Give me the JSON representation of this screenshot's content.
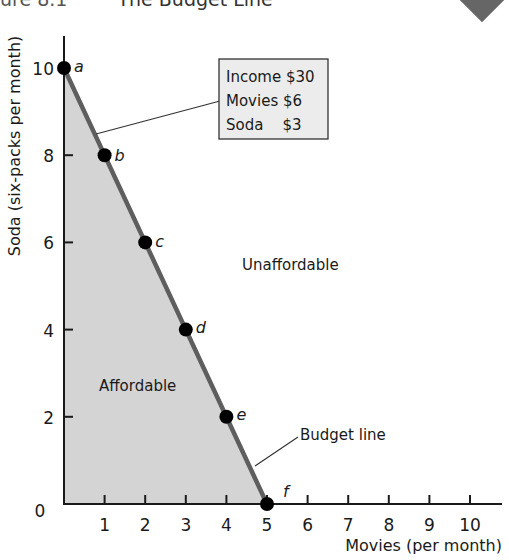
{
  "header": {
    "figure_label": "ure 8.1",
    "title": "The Budget Line"
  },
  "colors": {
    "affordable_fill": "#d4d4d4",
    "budget_line": "#5e5e5e",
    "axis": "#1a1a1a",
    "point": "#000000",
    "diamond": "#666666"
  },
  "legend_box": {
    "lines": [
      "Income $30",
      "Movies $6",
      "Soda    $3"
    ]
  },
  "labels": {
    "unaffordable": "Unaffordable",
    "affordable": "Affordable",
    "budget_line": "Budget line"
  },
  "chart_data": {
    "type": "line",
    "title": "The Budget Line",
    "xlabel": "Movies (per month)",
    "ylabel": "Soda (six-packs per month)",
    "xlim": [
      0,
      10
    ],
    "ylim": [
      0,
      10
    ],
    "x_ticks": [
      1,
      2,
      3,
      4,
      5,
      6,
      7,
      8,
      9,
      10
    ],
    "y_ticks": [
      2,
      4,
      6,
      8,
      10
    ],
    "origin_label": "0",
    "grid": false,
    "legend": "none",
    "series": [
      {
        "name": "Budget line",
        "points": [
          {
            "label": "a",
            "x": 0,
            "y": 10
          },
          {
            "label": "b",
            "x": 1,
            "y": 8
          },
          {
            "label": "c",
            "x": 2,
            "y": 6
          },
          {
            "label": "d",
            "x": 3,
            "y": 4
          },
          {
            "label": "e",
            "x": 4,
            "y": 2
          },
          {
            "label": "f",
            "x": 5,
            "y": 0
          }
        ]
      }
    ],
    "regions": [
      {
        "name": "Affordable",
        "below_line": true
      },
      {
        "name": "Unaffordable",
        "below_line": false
      }
    ],
    "annotations": [
      {
        "text": "Income $30",
        "box": true
      },
      {
        "text": "Movies $6",
        "box": true
      },
      {
        "text": "Soda $3",
        "box": true
      },
      {
        "text": "Budget line",
        "pointer": true
      }
    ]
  }
}
